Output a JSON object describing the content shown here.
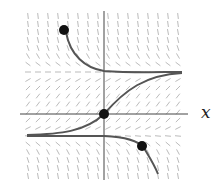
{
  "diagram": {
    "type": "slope-field",
    "axis_label_x": "x",
    "colors": {
      "axes": "#444444",
      "curves": "#555555",
      "field": "#bbbbbb",
      "points": "#111111"
    },
    "equilibria_y_px": [
      72,
      135
    ],
    "points": [
      {
        "name": "upper-left-point",
        "x": 64,
        "y": 30
      },
      {
        "name": "origin-point",
        "x": 104,
        "y": 114
      },
      {
        "name": "lower-right-point",
        "x": 142,
        "y": 146
      }
    ]
  }
}
